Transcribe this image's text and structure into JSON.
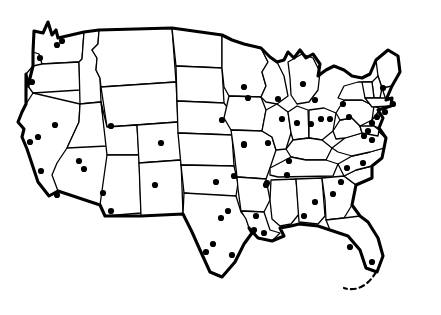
{
  "figure": {
    "kind": "map",
    "region": "Contiguous United States",
    "projection_hint": "pseudo-conic",
    "width": 441,
    "height": 315,
    "background_color": "#ffffff",
    "line_color": "#000000",
    "state_border_width": 1.3,
    "national_outline_width": 3.1,
    "dot_color": "#000000",
    "dot_radius": 3.1,
    "has_labels": false,
    "has_legend": false,
    "has_title_text": false,
    "has_scale_bar": false,
    "has_compass": false
  },
  "dots": {
    "count": 62,
    "marker_shape": "filled-circle",
    "points": [
      {
        "name": "seattle",
        "x": 62,
        "y": 41
      },
      {
        "name": "tacoma",
        "x": 57,
        "y": 45
      },
      {
        "name": "portland",
        "x": 40,
        "y": 58
      },
      {
        "name": "eugene",
        "x": 32,
        "y": 82
      },
      {
        "name": "spokane-area",
        "x": 84,
        "y": 169
      },
      {
        "name": "reno",
        "x": 55,
        "y": 125
      },
      {
        "name": "sacramento",
        "x": 38,
        "y": 137
      },
      {
        "name": "san-francisco",
        "x": 30,
        "y": 142
      },
      {
        "name": "las-vegas",
        "x": 79,
        "y": 161
      },
      {
        "name": "los-angeles",
        "x": 41,
        "y": 171
      },
      {
        "name": "san-diego",
        "x": 57,
        "y": 195
      },
      {
        "name": "phoenix",
        "x": 103,
        "y": 193
      },
      {
        "name": "tucson",
        "x": 111,
        "y": 211
      },
      {
        "name": "salt-lake-city",
        "x": 111,
        "y": 126
      },
      {
        "name": "denver",
        "x": 161,
        "y": 143
      },
      {
        "name": "albuquerque",
        "x": 155,
        "y": 185
      },
      {
        "name": "billings",
        "x": 244,
        "y": 87
      },
      {
        "name": "omaha",
        "x": 222,
        "y": 120
      },
      {
        "name": "kansas-city",
        "x": 244,
        "y": 145
      },
      {
        "name": "wichita",
        "x": 234,
        "y": 176
      },
      {
        "name": "oklahoma-city",
        "x": 216,
        "y": 182
      },
      {
        "name": "tulsa",
        "x": 267,
        "y": 183
      },
      {
        "name": "dallas",
        "x": 228,
        "y": 211
      },
      {
        "name": "fort-worth",
        "x": 221,
        "y": 218
      },
      {
        "name": "austin",
        "x": 213,
        "y": 244
      },
      {
        "name": "san-antonio",
        "x": 206,
        "y": 252
      },
      {
        "name": "houston",
        "x": 232,
        "y": 255
      },
      {
        "name": "corpus-christi",
        "x": 254,
        "y": 230
      },
      {
        "name": "new-orleans",
        "x": 264,
        "y": 233
      },
      {
        "name": "baton-rouge",
        "x": 256,
        "y": 216
      },
      {
        "name": "memphis",
        "x": 266,
        "y": 185
      },
      {
        "name": "nashville",
        "x": 287,
        "y": 175
      },
      {
        "name": "birmingham",
        "x": 315,
        "y": 202
      },
      {
        "name": "atlanta",
        "x": 333,
        "y": 194
      },
      {
        "name": "jackson",
        "x": 304,
        "y": 216
      },
      {
        "name": "louisville",
        "x": 289,
        "y": 161
      },
      {
        "name": "st-louis",
        "x": 244,
        "y": 144
      },
      {
        "name": "chicago",
        "x": 282,
        "y": 119
      },
      {
        "name": "springfield-il",
        "x": 268,
        "y": 143
      },
      {
        "name": "milwaukee",
        "x": 278,
        "y": 99
      },
      {
        "name": "minneapolis",
        "x": 248,
        "y": 98
      },
      {
        "name": "detroit",
        "x": 315,
        "y": 100
      },
      {
        "name": "grand-rapids",
        "x": 303,
        "y": 84
      },
      {
        "name": "indianapolis",
        "x": 297,
        "y": 123
      },
      {
        "name": "cincinnati",
        "x": 311,
        "y": 124
      },
      {
        "name": "columbus",
        "x": 321,
        "y": 119
      },
      {
        "name": "cleveland",
        "x": 330,
        "y": 119
      },
      {
        "name": "pittsburgh",
        "x": 349,
        "y": 117
      },
      {
        "name": "buffalo",
        "x": 343,
        "y": 104
      },
      {
        "name": "philadelphia",
        "x": 372,
        "y": 123
      },
      {
        "name": "baltimore",
        "x": 368,
        "y": 131
      },
      {
        "name": "washington-dc",
        "x": 364,
        "y": 136
      },
      {
        "name": "richmond",
        "x": 372,
        "y": 140
      },
      {
        "name": "new-york",
        "x": 377,
        "y": 117
      },
      {
        "name": "hartford",
        "x": 385,
        "y": 112
      },
      {
        "name": "boston",
        "x": 393,
        "y": 104
      },
      {
        "name": "portland-me",
        "x": 383,
        "y": 88
      },
      {
        "name": "charlotte",
        "x": 347,
        "y": 168
      },
      {
        "name": "raleigh",
        "x": 363,
        "y": 163
      },
      {
        "name": "columbia-sc",
        "x": 341,
        "y": 182
      },
      {
        "name": "tampa",
        "x": 350,
        "y": 247
      },
      {
        "name": "miami",
        "x": 372,
        "y": 262
      }
    ]
  }
}
